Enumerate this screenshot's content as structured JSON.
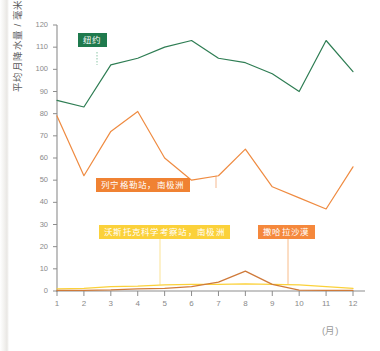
{
  "chart_data": {
    "type": "line",
    "title": "",
    "xlabel": "(月)",
    "ylabel": "平均月降水量 / 毫米",
    "x": [
      1,
      2,
      3,
      4,
      5,
      6,
      7,
      8,
      9,
      10,
      11,
      12
    ],
    "xtick_labels": [
      "1",
      "2",
      "3",
      "4",
      "5",
      "6",
      "7",
      "8",
      "9",
      "10",
      "11",
      "12"
    ],
    "ytick_labels": [
      "0",
      "10",
      "20",
      "30",
      "40",
      "50",
      "60",
      "70",
      "80",
      "90",
      "100",
      "110",
      "120"
    ],
    "ylim": [
      0,
      120
    ],
    "xlim": [
      1,
      12
    ],
    "grid": false,
    "legend_position": "inline-annotations",
    "series": [
      {
        "name": "纽约",
        "color": "#2e7d53",
        "values": [
          86,
          83,
          102,
          105,
          110,
          113,
          105,
          103,
          98,
          90,
          113,
          99
        ]
      },
      {
        "name": "列宁格勒站，南极洲",
        "color": "#ef8b41",
        "values": [
          79,
          52,
          72,
          81,
          60,
          50,
          52,
          64,
          47,
          42,
          37,
          56
        ]
      },
      {
        "name": "撒哈拉沙漠",
        "color": "#cf7a3a",
        "values": [
          0.3,
          0.3,
          0.5,
          1,
          1.2,
          2,
          4,
          9,
          3,
          0.4,
          0.3,
          0.3
        ]
      },
      {
        "name": "沃斯托克科学考察站，南极洲",
        "color": "#fbd13a",
        "values": [
          1,
          1.2,
          2,
          2.2,
          2.8,
          3,
          3,
          3.2,
          3,
          2.8,
          2,
          1.2
        ]
      }
    ],
    "annotations": [
      {
        "text": "纽约",
        "color": "#1f7a4d",
        "anchor_month": 3,
        "anchor_value": 102
      },
      {
        "text": "列宁格勒站，南极洲",
        "color": "#f08232",
        "anchor_month": 7,
        "anchor_value": 52
      },
      {
        "text": "沃斯托克科学考察站，南极洲",
        "color": "#fbd13a",
        "anchor_month": 5,
        "anchor_value": 2.8
      },
      {
        "text": "撒哈拉沙漠",
        "color": "#f5883c",
        "anchor_month": 9,
        "anchor_value": 3
      }
    ]
  }
}
